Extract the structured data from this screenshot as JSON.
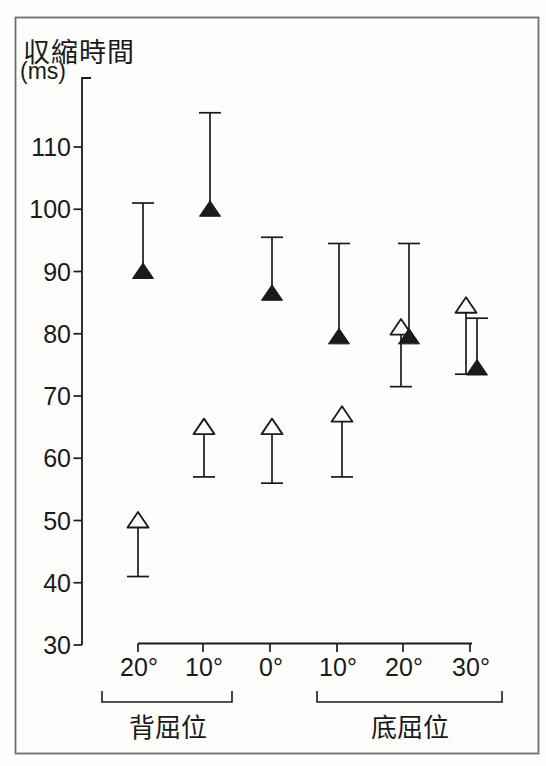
{
  "figure": {
    "title": "収縮時間",
    "unit": "(ms)"
  },
  "chart_data": {
    "type": "scatter",
    "title": "収縮時間",
    "ylabel": "収縮時間 (ms)",
    "xlabel": "",
    "ylim": [
      30,
      121
    ],
    "yticks": [
      110,
      100,
      90,
      80,
      70,
      60,
      50,
      40,
      30
    ],
    "x_categories": [
      "20°",
      "10°",
      "0°",
      "10°",
      "20°",
      "30°"
    ],
    "x_groups": [
      {
        "label": "背屈位",
        "categories": [
          "20°",
          "10°"
        ]
      },
      {
        "label": "底屈位",
        "categories": [
          "10°",
          "20°",
          "30°"
        ]
      }
    ],
    "grid": false,
    "legend": "none",
    "series": [
      {
        "name": "filled-triangle",
        "marker": "triangle-filled",
        "error_bar": "upward",
        "values": [
          90,
          100,
          86.5,
          79.5,
          79.5,
          74.5
        ],
        "error_tip": [
          101,
          115.5,
          95.5,
          94.5,
          94.5,
          82.5
        ]
      },
      {
        "name": "open-triangle",
        "marker": "triangle-open",
        "error_bar": "downward",
        "values": [
          50,
          65,
          65,
          67,
          81,
          84.5
        ],
        "error_tip": [
          41,
          57,
          56,
          57,
          71.5,
          73.5
        ]
      }
    ],
    "colors": {
      "ink": "#1a1a1a",
      "paper": "#fdfdfc",
      "frame": "#6f6f6f"
    }
  }
}
